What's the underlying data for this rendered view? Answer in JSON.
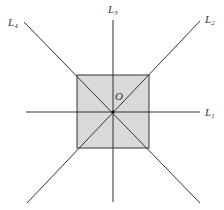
{
  "diagram": {
    "center_label": "O",
    "lines": [
      {
        "name": "L",
        "sub": "1"
      },
      {
        "name": "L",
        "sub": "2"
      },
      {
        "name": "L",
        "sub": "3"
      },
      {
        "name": "L",
        "sub": "4"
      }
    ],
    "colors": {
      "square_fill": "#d9d9d9",
      "stroke": "#333333"
    }
  }
}
